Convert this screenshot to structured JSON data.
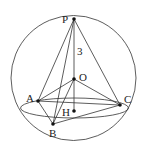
{
  "figure": {
    "sphere": {
      "cx": 73.5,
      "cy": 78,
      "r": 62.5
    },
    "equator": {
      "cx": 74.5,
      "cy": 108,
      "rx": 54,
      "ry": 10
    },
    "points": [
      {
        "name": "P",
        "x": 74,
        "y": 19,
        "lx": 62,
        "ly": 23
      },
      {
        "name": "O",
        "x": 74,
        "y": 79,
        "lx": 79,
        "ly": 81
      },
      {
        "name": "A",
        "x": 38,
        "y": 101,
        "lx": 26,
        "ly": 102
      },
      {
        "name": "B",
        "x": 53,
        "y": 124,
        "lx": 49,
        "ly": 137
      },
      {
        "name": "C",
        "x": 120,
        "y": 105,
        "lx": 124,
        "ly": 103
      },
      {
        "name": "H",
        "x": 74,
        "y": 111,
        "lx": 62,
        "ly": 116
      }
    ],
    "segments": [
      [
        "P",
        "A"
      ],
      [
        "P",
        "B"
      ],
      [
        "P",
        "C"
      ],
      [
        "P",
        "H"
      ],
      [
        "A",
        "B"
      ],
      [
        "B",
        "C"
      ],
      [
        "A",
        "C"
      ],
      [
        "O",
        "A"
      ],
      [
        "O",
        "B"
      ],
      [
        "O",
        "C"
      ]
    ],
    "annotation": {
      "text": "3",
      "x": 77,
      "y": 55
    }
  }
}
